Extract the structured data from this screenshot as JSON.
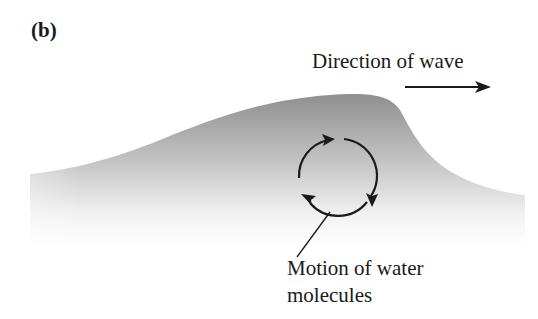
{
  "figure": {
    "panel_label": "(b)",
    "direction_label": "Direction of wave",
    "motion_label_line1": "Motion of water",
    "motion_label_line2": "molecules"
  },
  "elements": {
    "wave": "wave-crest-shaded",
    "direction_arrow": "arrow-right",
    "circular_motion": "clockwise-circle-arrows",
    "leader_line": "pointer-line"
  },
  "colors": {
    "ink": "#1a1a1a",
    "wave_dark": "#8c8c8c",
    "wave_light": "#ffffff",
    "background": "#ffffff"
  }
}
